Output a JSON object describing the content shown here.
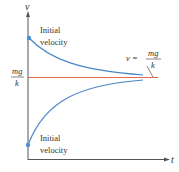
{
  "axes": {
    "y_label": "v",
    "x_label": "t"
  },
  "labels": {
    "top_initial_line1": "Initial",
    "top_initial_line2": "velocity",
    "bottom_initial_line1": "Initial",
    "bottom_initial_line2": "velocity",
    "terminal_left_num": "mg",
    "terminal_left_den": "k",
    "terminal_eq_lhs": "v =",
    "terminal_eq_num": "mg",
    "terminal_eq_den": "k"
  },
  "colors": {
    "curve": "#4a86c8",
    "terminal_line": "#e06a4a",
    "axis": "#555555",
    "dot": "#4a90d9",
    "text": "#333333"
  }
}
